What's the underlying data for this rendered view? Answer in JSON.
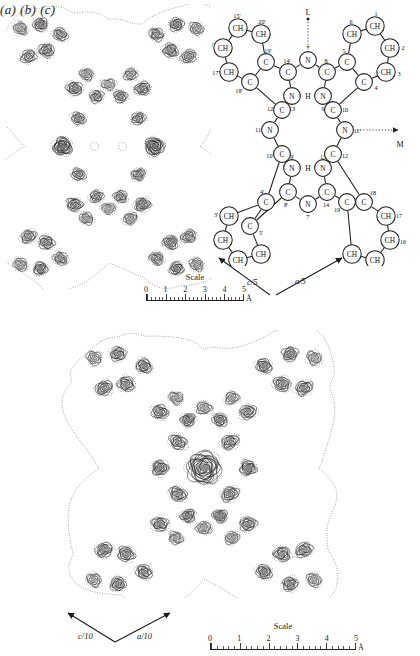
{
  "figure": {
    "kind": "crystallographic-electron-density-figure",
    "panels": [
      {
        "id": "a",
        "label": "(a)",
        "description": "Electron density contour map, projection down b; two heavy dark peaks flank an empty centre"
      },
      {
        "id": "b",
        "label": "(b)",
        "description": "Chemical structure diagram of the macrocycle with numbered atoms"
      },
      {
        "id": "c",
        "label": "(c)",
        "description": "Electron density contour map with a single strong central peak"
      }
    ]
  },
  "panel_a": {
    "label": "(a)",
    "scale": {
      "title": "Scale",
      "ticks": [
        "0",
        "1",
        "2",
        "3",
        "4",
        "5"
      ],
      "unit": "Å"
    },
    "axes": [
      {
        "name": "c-over-5",
        "label": "c/5",
        "numerator": "c",
        "denominator": "5",
        "direction": "up-left"
      }
    ]
  },
  "panel_b": {
    "label": "(b)",
    "direction_markers": [
      {
        "name": "L",
        "label": "L",
        "position": "top",
        "style": "dotted-line-with-dot"
      },
      {
        "name": "M",
        "label": "M",
        "position": "right",
        "style": "dotted-arrow"
      }
    ],
    "bridge_hydrogens": [
      "H",
      "H"
    ],
    "axes": [
      {
        "name": "a-over-5",
        "label": "a/5",
        "numerator": "a",
        "denominator": "5",
        "direction": "up-right"
      }
    ],
    "atoms": {
      "top_left_ring": [
        {
          "id": "15p",
          "symbol": "CH",
          "number": "15'"
        },
        {
          "id": "20p",
          "symbol": "CH",
          "number": "20'"
        },
        {
          "id": "16p",
          "symbol": "CH",
          "number": "16'"
        },
        {
          "id": "17p",
          "symbol": "CH",
          "number": "17'"
        },
        {
          "id": "19p",
          "symbol": "C",
          "number": "19'"
        },
        {
          "id": "18p",
          "symbol": "C",
          "number": "18'"
        }
      ],
      "top_right_ring": [
        {
          "id": "1",
          "symbol": "CH",
          "number": "1"
        },
        {
          "id": "6",
          "symbol": "CH",
          "number": "6"
        },
        {
          "id": "2",
          "symbol": "CH",
          "number": "2",
          "subscript": "2"
        },
        {
          "id": "3",
          "symbol": "CH",
          "number": "3",
          "subscript": "3"
        },
        {
          "id": "5",
          "symbol": "C",
          "number": "5"
        },
        {
          "id": "4",
          "symbol": "C",
          "number": "4"
        }
      ],
      "bottom_left_ring": [
        {
          "id": "1b",
          "symbol": "CH",
          "number": "1'"
        },
        {
          "id": "6b",
          "symbol": "CH",
          "number": "6'"
        },
        {
          "id": "2b",
          "symbol": "CH",
          "number": "2'"
        },
        {
          "id": "3b",
          "symbol": "CH",
          "number": "3'"
        },
        {
          "id": "5b",
          "symbol": "C",
          "number": "5'"
        },
        {
          "id": "4b",
          "symbol": "C",
          "number": "4'"
        }
      ],
      "bottom_right_ring": [
        {
          "id": "15",
          "symbol": "CH",
          "number": "15"
        },
        {
          "id": "20",
          "symbol": "CH",
          "number": "20"
        },
        {
          "id": "16",
          "symbol": "CH",
          "number": "16"
        },
        {
          "id": "17",
          "symbol": "CH",
          "number": "17"
        },
        {
          "id": "19",
          "symbol": "C",
          "number": "19"
        },
        {
          "id": "18",
          "symbol": "C",
          "number": "18"
        }
      ],
      "nitrogens": [
        {
          "id": "N7",
          "symbol": "N",
          "number": "7"
        },
        {
          "id": "N13",
          "symbol": "N",
          "number": "13"
        },
        {
          "id": "N9",
          "symbol": "N",
          "number": "9"
        },
        {
          "id": "N11",
          "symbol": "N",
          "number": "11"
        },
        {
          "id": "N9p",
          "symbol": "N",
          "number": "9'"
        },
        {
          "id": "N13b",
          "symbol": "N",
          "number": "13"
        },
        {
          "id": "N11p",
          "symbol": "N",
          "number": "11'"
        },
        {
          "id": "N7p",
          "symbol": "N",
          "number": "7'"
        }
      ],
      "bridge_carbons": [
        {
          "id": "C14",
          "symbol": "C",
          "number": "14'"
        },
        {
          "id": "C8",
          "symbol": "C",
          "number": "8"
        },
        {
          "id": "C12",
          "symbol": "C",
          "number": "12"
        },
        {
          "id": "C10",
          "symbol": "C",
          "number": "10"
        },
        {
          "id": "C10p",
          "symbol": "C",
          "number": "10'"
        },
        {
          "id": "C12p",
          "symbol": "C",
          "number": "12"
        },
        {
          "id": "C8p",
          "symbol": "C",
          "number": "8'"
        },
        {
          "id": "C14b",
          "symbol": "C",
          "number": "14"
        }
      ]
    }
  },
  "panel_c": {
    "label": "(c)",
    "scale": {
      "title": "Scale",
      "ticks": [
        "0",
        "1",
        "2",
        "3",
        "4",
        "5"
      ],
      "unit": "Å"
    },
    "axes": [
      {
        "name": "c-over-10",
        "label": "c/10",
        "numerator": "c",
        "denominator": "10",
        "direction": "up-left"
      },
      {
        "name": "a-over-10",
        "label": "a/10",
        "numerator": "a",
        "denominator": "10",
        "direction": "up-right"
      }
    ]
  },
  "colors": {
    "ink": "#1d1d1d",
    "contour": "#2b2b2b",
    "contour_dotted": "#4a4a4a",
    "background": "#ffffff"
  }
}
